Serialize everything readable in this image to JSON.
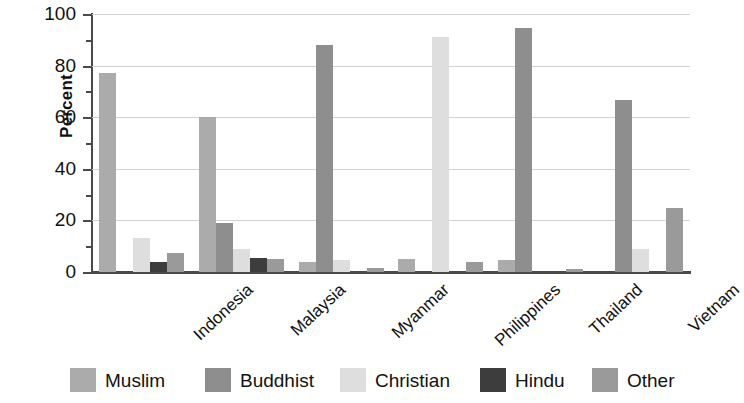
{
  "chart_data": {
    "type": "bar",
    "title": "",
    "xlabel": "",
    "ylabel": "Percent",
    "ylim": [
      0,
      100
    ],
    "ytick_labels": [
      "0",
      "20",
      "40",
      "60",
      "80",
      "100"
    ],
    "ytick_values": [
      0,
      20,
      40,
      60,
      80,
      100
    ],
    "minor_tick_step": 10,
    "grid": "horizontal",
    "legend_position": "bottom",
    "categories": [
      "Indonesia",
      "Malaysia",
      "Myanmar",
      "Philippines",
      "Thailand",
      "Vietnam"
    ],
    "series": [
      {
        "name": "Muslim",
        "color": "#ababab",
        "texture": "solid",
        "values": [
          77.0,
          60.0,
          4.0,
          5.0,
          4.6,
          0.0
        ]
      },
      {
        "name": "Buddhist",
        "color": "#8e8e8e",
        "texture": "hatch",
        "values": [
          0.0,
          19.0,
          88.0,
          0.0,
          94.5,
          66.5
        ]
      },
      {
        "name": "Christian",
        "color": "#dedede",
        "texture": "dot",
        "values": [
          13.0,
          9.0,
          4.5,
          91.0,
          0.0,
          9.0
        ]
      },
      {
        "name": "Hindu",
        "color": "#3d3d3d",
        "texture": "solid",
        "values": [
          4.0,
          5.5,
          0.0,
          0.0,
          0.0,
          0.0
        ]
      },
      {
        "name": "Other",
        "color": "#9a9a9a",
        "texture": "solid",
        "values": [
          7.5,
          5.0,
          1.5,
          4.0,
          1.0,
          24.8
        ]
      }
    ]
  },
  "legend": {
    "items": [
      {
        "label": "Muslim",
        "color": "#ababab"
      },
      {
        "label": "Buddhist",
        "color": "#8e8e8e"
      },
      {
        "label": "Christian",
        "color": "#dedede"
      },
      {
        "label": "Hindu",
        "color": "#3d3d3d"
      },
      {
        "label": "Other",
        "color": "#9a9a9a"
      }
    ]
  },
  "axis": {
    "y_title": "Percent"
  },
  "colors": {
    "axis": "#4a4a4a",
    "grid": "#d2d2d2",
    "text": "#111111",
    "background": "#ffffff"
  }
}
